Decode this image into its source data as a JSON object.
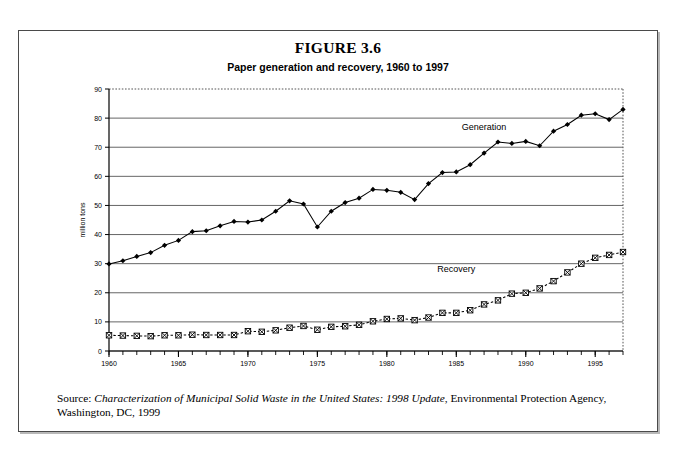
{
  "figure": {
    "number_label": "FIGURE 3.6",
    "subtitle": "Paper generation and recovery, 1960 to 1997",
    "source_prefix": "Source: ",
    "source_italic": "Characterization of Municipal Solid Waste in the United States: 1998 Update",
    "source_rest": ", Environmental Protection Agency, Washington, DC, 1999"
  },
  "chart_data": {
    "type": "line",
    "title": "Paper generation and recovery, 1960 to 1997",
    "xlabel": "",
    "ylabel": "million tons",
    "xlim": [
      1960,
      1997
    ],
    "ylim": [
      0,
      90
    ],
    "ytick_step": 10,
    "yticks": [
      0,
      10,
      20,
      30,
      40,
      50,
      60,
      70,
      80,
      90
    ],
    "xticks_labeled": [
      1960,
      1965,
      1970,
      1975,
      1980,
      1985,
      1990,
      1995
    ],
    "xticks_minor_step": 1,
    "grid": "horizontal",
    "legend": "inline-labels",
    "x": [
      1960,
      1961,
      1962,
      1963,
      1964,
      1965,
      1966,
      1967,
      1968,
      1969,
      1970,
      1971,
      1972,
      1973,
      1974,
      1975,
      1976,
      1977,
      1978,
      1979,
      1980,
      1981,
      1982,
      1983,
      1984,
      1985,
      1986,
      1987,
      1988,
      1989,
      1990,
      1991,
      1992,
      1993,
      1994,
      1995,
      1996,
      1997
    ],
    "series": [
      {
        "name": "Generation",
        "marker": "diamond",
        "line": "solid",
        "label_x": 1987,
        "label_y": 76,
        "values": [
          29.9,
          31.0,
          32.5,
          33.8,
          36.3,
          38.0,
          41.0,
          41.3,
          43.0,
          44.5,
          44.3,
          45.0,
          48.0,
          51.6,
          50.5,
          42.6,
          48.0,
          51.0,
          52.5,
          55.5,
          55.2,
          54.5,
          52.0,
          57.5,
          61.3,
          61.5,
          64.0,
          68.0,
          71.8,
          71.3,
          72.0,
          70.5,
          75.5,
          77.8,
          81.0,
          81.5,
          79.5,
          83.0
        ]
      },
      {
        "name": "Recovery",
        "marker": "square-x",
        "line": "dashed",
        "label_x": 1985,
        "label_y": 27,
        "values": [
          5.4,
          5.3,
          5.2,
          5.1,
          5.4,
          5.4,
          5.6,
          5.5,
          5.5,
          5.5,
          6.8,
          6.6,
          7.1,
          8.0,
          8.6,
          7.3,
          8.3,
          8.5,
          9.0,
          10.2,
          11.0,
          11.2,
          10.6,
          11.5,
          13.1,
          13.1,
          14.0,
          16.0,
          17.4,
          19.7,
          20.0,
          21.5,
          24.0,
          27.0,
          30.0,
          32.0,
          33.0,
          34.0
        ]
      }
    ]
  }
}
